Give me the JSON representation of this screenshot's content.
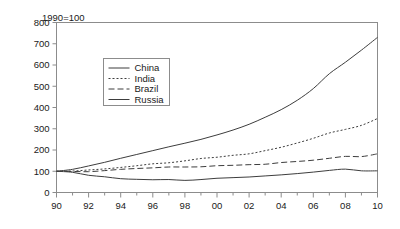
{
  "chart_data": {
    "type": "line",
    "title": "",
    "note": "1990=100",
    "xlabel": "",
    "ylabel": "",
    "xlim": [
      1990,
      2010
    ],
    "ylim": [
      0,
      800
    ],
    "ytick_step": 100,
    "grid": false,
    "legend_position": "upper-center-left",
    "ytick_labels": [
      "0",
      "100",
      "200",
      "300",
      "400",
      "500",
      "600",
      "700",
      "800"
    ],
    "ytick_values": [
      0,
      100,
      200,
      300,
      400,
      500,
      600,
      700,
      800
    ],
    "xtick_labels": [
      "90",
      "92",
      "94",
      "96",
      "98",
      "00",
      "02",
      "04",
      "06",
      "08",
      "10"
    ],
    "xtick_values": [
      1990,
      1992,
      1994,
      1996,
      1998,
      2000,
      2002,
      2004,
      2006,
      2008,
      2010
    ],
    "x": [
      1990,
      1991,
      1992,
      1993,
      1994,
      1995,
      1996,
      1997,
      1998,
      1999,
      2000,
      2001,
      2002,
      2003,
      2004,
      2005,
      2006,
      2007,
      2008,
      2009,
      2010
    ],
    "series": [
      {
        "name": "China",
        "style": "solid",
        "color": "#3d3d3d",
        "values": [
          100,
          109,
          125,
          142,
          161,
          179,
          197,
          215,
          232,
          250,
          271,
          294,
          321,
          354,
          390,
          434,
          489,
          559,
          613,
          670,
          730
        ]
      },
      {
        "name": "India",
        "style": "dotted",
        "color": "#3d3d3d",
        "values": [
          100,
          101,
          106,
          111,
          118,
          126,
          135,
          140,
          149,
          160,
          166,
          175,
          182,
          197,
          213,
          233,
          255,
          280,
          297,
          316,
          348
        ]
      },
      {
        "name": "Brazil",
        "style": "dashed",
        "color": "#3d3d3d",
        "values": [
          100,
          99,
          98,
          103,
          109,
          113,
          116,
          120,
          120,
          121,
          126,
          128,
          131,
          133,
          141,
          146,
          152,
          161,
          170,
          169,
          182
        ]
      },
      {
        "name": "Russia",
        "style": "solid",
        "color": "#3d3d3d",
        "values": [
          100,
          95,
          81,
          74,
          65,
          62,
          60,
          61,
          57,
          61,
          67,
          70,
          73,
          78,
          83,
          89,
          96,
          104,
          110,
          102,
          102
        ]
      }
    ]
  },
  "legend": {
    "entries": [
      {
        "label": "China"
      },
      {
        "label": "India"
      },
      {
        "label": "Brazil"
      },
      {
        "label": "Russia"
      }
    ]
  }
}
